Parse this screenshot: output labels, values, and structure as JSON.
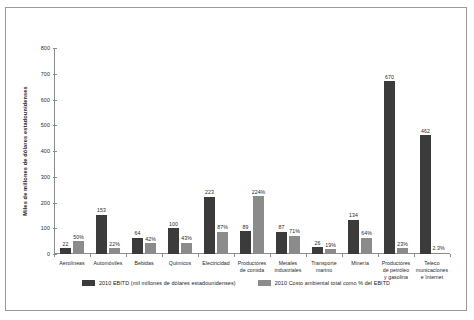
{
  "chart_data": {
    "type": "bar",
    "title": "",
    "subtitle": "",
    "xlabel": "",
    "ylabel": "Miles de millones de dólares estadounidenses",
    "ylim": [
      0,
      800
    ],
    "yticks": [
      0,
      100,
      200,
      300,
      400,
      500,
      600,
      700,
      800
    ],
    "ytick_labels": [
      "0",
      "100",
      "200",
      "300",
      "400",
      "500",
      "600",
      "700",
      "800"
    ],
    "grid": false,
    "legend_position": "bottom",
    "categories": [
      "Aerolíneas",
      "Automóviles",
      "Bebidas",
      "Químicos",
      "Electricidad",
      "Productores de comida",
      "Metales industriales",
      "Transporte marino",
      "Minería",
      "Productores de petróleo y gasolina",
      "Telecomunicaciones e Internet"
    ],
    "category_lines": [
      [
        "Aerolíneas"
      ],
      [
        "Automóviles"
      ],
      [
        "Bebidas"
      ],
      [
        "Químicos"
      ],
      [
        "Electricidad"
      ],
      [
        "Productores",
        "de comida"
      ],
      [
        "Metales",
        "industriales"
      ],
      [
        "Transporte",
        "marino"
      ],
      [
        "Minería"
      ],
      [
        "Productores",
        "de petróleo",
        "y gasolina"
      ],
      [
        "Teleco",
        "municaciones",
        "e Internet"
      ]
    ],
    "series": [
      {
        "name": "2010 EBITD (mil millones de dólares estadounidenses)",
        "color": "#3b3b3b",
        "values": [
          22,
          153,
          64,
          100,
          223,
          89,
          87,
          26,
          134,
          670,
          462
        ],
        "labels": [
          "22",
          "153",
          "64",
          "100",
          "223",
          "89",
          "87",
          "26",
          "134",
          "670",
          "462"
        ]
      },
      {
        "name": "2010 Costo ambiental total como % del EBITD",
        "color": "#8b8b8b",
        "values": [
          50,
          22,
          42,
          43,
          87,
          224,
          71,
          19,
          64,
          23,
          2.3
        ],
        "labels": [
          "50%",
          "22%",
          "42%",
          "43%",
          "87%",
          "224%",
          "71%",
          "19%",
          "64%",
          "23%",
          "2.3%"
        ]
      }
    ]
  },
  "legend": {
    "entries": [
      {
        "label": "2010 EBITD (mil millones de dólares estadounidenses)",
        "swatch": "dark"
      },
      {
        "label": "2010 Costo ambiental total como % del EBITD",
        "swatch": "gray"
      }
    ]
  }
}
